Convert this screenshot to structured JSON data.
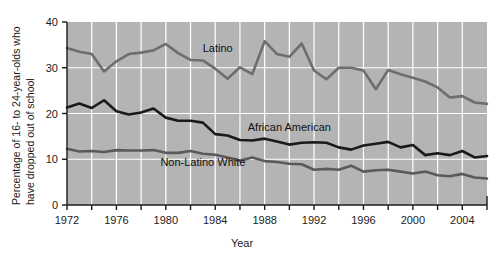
{
  "chart_data": {
    "type": "line",
    "title": "",
    "xlabel": "Year",
    "ylabel": "Percentage of 16- to 24-year-olds who have dropped out of school",
    "ylabel_line1": "Percentage of 16- to  24-year-olds who",
    "ylabel_line2": "have dropped out of school",
    "xlim": [
      1972,
      2006
    ],
    "ylim": [
      0,
      40
    ],
    "yticks": [
      0,
      10,
      20,
      30,
      40
    ],
    "ytick_labels": [
      "0",
      "10",
      "20",
      "30",
      "40"
    ],
    "xticks": [
      1972,
      1974,
      1976,
      1978,
      1980,
      1982,
      1984,
      1986,
      1988,
      1990,
      1992,
      1994,
      1996,
      1998,
      2000,
      2002,
      2004,
      2006
    ],
    "xtick_labels_shown": [
      "1972",
      "1976",
      "1980",
      "1984",
      "1988",
      "1992",
      "1996",
      "2000",
      "2004"
    ],
    "xtick_labels_shown_values": [
      1972,
      1976,
      1980,
      1984,
      1988,
      1992,
      1996,
      2000,
      2004
    ],
    "grid": true,
    "grid_color": "#ffffff",
    "plot_background": "#b4b4b4",
    "legend_position": "inline-labels",
    "x": [
      1972,
      1973,
      1974,
      1975,
      1976,
      1977,
      1978,
      1979,
      1980,
      1981,
      1982,
      1983,
      1984,
      1985,
      1986,
      1987,
      1988,
      1989,
      1990,
      1991,
      1992,
      1993,
      1994,
      1995,
      1996,
      1997,
      1998,
      1999,
      2000,
      2001,
      2002,
      2003,
      2004,
      2005,
      2006
    ],
    "series": [
      {
        "name": "Latino",
        "color": "#6e6e6e",
        "label_x": 1984.2,
        "label_y": 33.5,
        "values": [
          34.3,
          33.5,
          33.0,
          29.2,
          31.4,
          33.0,
          33.3,
          33.8,
          35.2,
          33.2,
          31.7,
          31.6,
          29.8,
          27.6,
          30.1,
          28.6,
          35.8,
          33.0,
          32.4,
          35.3,
          29.4,
          27.5,
          30.0,
          30.0,
          29.4,
          25.3,
          29.5,
          28.6,
          27.8,
          27.0,
          25.7,
          23.5,
          23.8,
          22.4,
          22.1
        ]
      },
      {
        "name": "African American",
        "color": "#1a1a1a",
        "label_x": 1990.0,
        "label_y": 16.2,
        "values": [
          21.3,
          22.2,
          21.2,
          22.9,
          20.5,
          19.8,
          20.2,
          21.1,
          19.1,
          18.4,
          18.4,
          18.0,
          15.5,
          15.2,
          14.2,
          14.1,
          14.5,
          13.9,
          13.2,
          13.6,
          13.7,
          13.6,
          12.6,
          12.1,
          13.0,
          13.4,
          13.8,
          12.6,
          13.1,
          10.9,
          11.3,
          10.9,
          11.8,
          10.4,
          10.7
        ]
      },
      {
        "name": "Non-Latino White",
        "color": "#5a5a5a",
        "label_x": 1983.0,
        "label_y": 8.6,
        "values": [
          12.3,
          11.7,
          11.8,
          11.6,
          12.0,
          11.9,
          11.9,
          12.0,
          11.4,
          11.4,
          11.8,
          11.2,
          11.0,
          10.4,
          9.7,
          10.4,
          9.6,
          9.4,
          9.0,
          8.9,
          7.7,
          7.9,
          7.7,
          8.6,
          7.3,
          7.6,
          7.7,
          7.3,
          6.9,
          7.3,
          6.5,
          6.3,
          6.8,
          6.0,
          5.8
        ]
      }
    ]
  },
  "axis": {
    "x_axis_title": "Year"
  }
}
